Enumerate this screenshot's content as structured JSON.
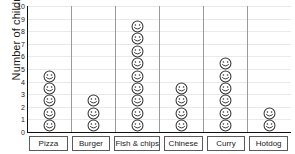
{
  "chart_data": {
    "type": "bar",
    "title": "",
    "subtitle": "",
    "xlabel": "",
    "ylabel": "Number of children",
    "categories": [
      "Pizza",
      "Burger",
      "Fish & chips",
      "Chinese",
      "Curry",
      "Hotdog"
    ],
    "values": [
      5,
      3,
      9,
      4,
      6,
      2
    ],
    "ylim": [
      0,
      10
    ],
    "ytick_labels": [
      "0",
      "1",
      "2",
      "3",
      "4",
      "5",
      "6",
      "7",
      "8",
      "9",
      "10"
    ],
    "ytick_values": [
      0,
      1,
      2,
      3,
      4,
      5,
      6,
      7,
      8,
      9,
      10
    ],
    "grid": true,
    "legend": "none",
    "pictogram": true,
    "symbol": "smiley-face",
    "symbol_value": 1,
    "colors": {
      "background": "#ffffff",
      "axis": "#111111",
      "gridline": "#e9e9e9",
      "divider": "#9a9a9a",
      "symbol_stroke": "#333333",
      "text": "#1a1a1a",
      "label_box_border": "#5a5a5a"
    }
  }
}
